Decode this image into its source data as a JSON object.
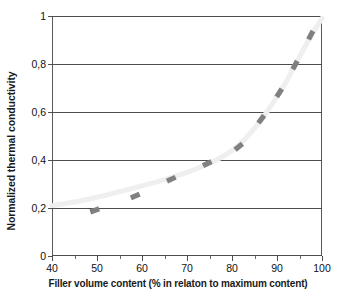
{
  "chart_data": {
    "type": "line",
    "title": "",
    "xlabel": "Filler volume content (% in relaton to maximum content)",
    "ylabel": "Normalized thermal conductivity",
    "xlim": [
      40,
      100
    ],
    "ylim": [
      0,
      1
    ],
    "xticks": [
      40,
      50,
      60,
      70,
      80,
      90,
      100
    ],
    "xtick_labels": [
      "40",
      "50",
      "60",
      "70",
      "80",
      "90",
      "100"
    ],
    "xminor_ticks": [
      45,
      55,
      65,
      75,
      85,
      95
    ],
    "yticks": [
      0,
      0.2,
      0.4,
      0.6,
      0.8,
      1
    ],
    "ytick_labels": [
      "0",
      "0,2",
      "0,4",
      "0,6",
      "0,8",
      "1"
    ],
    "grid": "horizontal",
    "legend": "none",
    "decimal_separator": ",",
    "series": [
      {
        "name": "Normalized thermal conductivity",
        "marker": "rotated-rectangle",
        "marker_color": "#808080",
        "line_color": "#efefef",
        "line_style": "solid",
        "x": [
          49.5,
          58.5,
          66.5,
          74.5,
          81.5,
          86.5,
          90.5,
          94.0,
          97.5
        ],
        "y": [
          0.19,
          0.25,
          0.32,
          0.385,
          0.455,
          0.57,
          0.68,
          0.795,
          0.92
        ]
      }
    ],
    "curve": {
      "description": "smooth exponential-like trend line from (40, 0.21) rising steeply to (100, 0.99)",
      "color": "#efefef",
      "width": 5,
      "points": [
        [
          40,
          0.21
        ],
        [
          45,
          0.225
        ],
        [
          50,
          0.245
        ],
        [
          55,
          0.268
        ],
        [
          60,
          0.292
        ],
        [
          65,
          0.318
        ],
        [
          70,
          0.348
        ],
        [
          74,
          0.378
        ],
        [
          77,
          0.405
        ],
        [
          80,
          0.44
        ],
        [
          83,
          0.49
        ],
        [
          86,
          0.555
        ],
        [
          89,
          0.635
        ],
        [
          92,
          0.725
        ],
        [
          95,
          0.83
        ],
        [
          97.5,
          0.915
        ],
        [
          100,
          0.99
        ]
      ]
    }
  },
  "axis_colors": {
    "gridline": "#4d4d4d",
    "axis": "#595959",
    "text": "#111111",
    "title_text": "#1a1a1a",
    "background": "#ffffff"
  }
}
